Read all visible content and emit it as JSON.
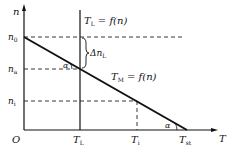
{
  "diagram": {
    "type": "torque-speed characteristic",
    "axes": {
      "y_label": "n",
      "x_label": "T",
      "origin_label": "O"
    },
    "y_ticks": [
      {
        "base": "n",
        "sub": "0"
      },
      {
        "base": "n",
        "sub": "a"
      },
      {
        "base": "n",
        "sub": "i"
      }
    ],
    "x_ticks": [
      {
        "base": "T",
        "sub": "L"
      },
      {
        "base": "T",
        "sub": "i"
      },
      {
        "base": "T",
        "sub": "st"
      }
    ],
    "curves": {
      "load": {
        "base": "T",
        "sub": "L",
        "eq": " = f(n)"
      },
      "motor": {
        "base": "T",
        "sub": "M",
        "eq": " = f(n)"
      }
    },
    "annotations": {
      "delta": {
        "prefix": "Δn",
        "sub": "L"
      },
      "angle1": "α",
      "angle2": "α"
    },
    "colors": {
      "line": "#111111",
      "dashed": "#222222"
    }
  }
}
